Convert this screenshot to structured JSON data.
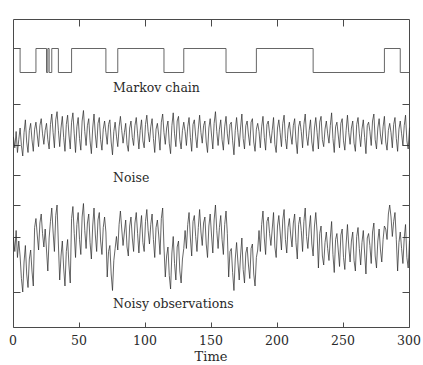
{
  "figure": {
    "background_color": "#ffffff",
    "line_color": "#2b2b2b",
    "frame_color": "#4a4a4a",
    "panel_labels": {
      "markov": "Markov chain",
      "noise": "Noise",
      "observations": "Noisy observations"
    }
  },
  "axis": {
    "xlabel": "Time",
    "ticks": [
      "0",
      "50",
      "100",
      "150",
      "200",
      "250",
      "300"
    ],
    "tick_values": [
      0,
      50,
      100,
      150,
      200,
      250,
      300
    ],
    "xlim": [
      0,
      300
    ]
  },
  "chart_data": {
    "type": "line",
    "title": "",
    "subtitle": "",
    "xlabel": "Time",
    "ylabel": "",
    "xlim": [
      0,
      300
    ],
    "grid": false,
    "legend": "none",
    "annotations": [
      "Markov chain",
      "Noise",
      "Noisy observations"
    ],
    "panels": [
      {
        "name": "markov-chain",
        "label": "Markov chain",
        "type": "step",
        "ylim": [
          0,
          1
        ],
        "description": "Binary hidden state sequence alternating between 0 and 1",
        "segments": [
          {
            "start": 0,
            "end": 5,
            "value": 1
          },
          {
            "start": 5,
            "end": 17,
            "value": 0
          },
          {
            "start": 17,
            "end": 25,
            "value": 1
          },
          {
            "start": 25,
            "end": 26,
            "value": 0
          },
          {
            "start": 26,
            "end": 27,
            "value": 1
          },
          {
            "start": 27,
            "end": 29,
            "value": 0
          },
          {
            "start": 29,
            "end": 34,
            "value": 1
          },
          {
            "start": 34,
            "end": 44,
            "value": 0
          },
          {
            "start": 44,
            "end": 70,
            "value": 1
          },
          {
            "start": 70,
            "end": 79,
            "value": 0
          },
          {
            "start": 79,
            "end": 114,
            "value": 1
          },
          {
            "start": 114,
            "end": 129,
            "value": 0
          },
          {
            "start": 129,
            "end": 161,
            "value": 1
          },
          {
            "start": 161,
            "end": 184,
            "value": 0
          },
          {
            "start": 184,
            "end": 227,
            "value": 1
          },
          {
            "start": 227,
            "end": 281,
            "value": 0
          },
          {
            "start": 281,
            "end": 293,
            "value": 1
          },
          {
            "start": 293,
            "end": 300,
            "value": 0
          }
        ]
      },
      {
        "name": "noise",
        "label": "Noise",
        "type": "line",
        "description": "Zero-mean white noise series over t = 0..300",
        "ylim": [
          -3,
          3
        ],
        "x_step": 1,
        "values": [
          -0.2,
          -1.1,
          0.3,
          -1.5,
          -0.4,
          0.6,
          -0.9,
          -1.8,
          0.2,
          1.3,
          -0.6,
          -1.5,
          0.4,
          1.0,
          -0.4,
          -1.4,
          0.5,
          1.1,
          0.0,
          -1.0,
          0.8,
          1.4,
          0.1,
          -0.8,
          0.4,
          1.0,
          -0.4,
          -1.2,
          0.9,
          1.8,
          0.2,
          -1.1,
          1.3,
          2.0,
          0.4,
          -1.0,
          0.6,
          1.6,
          -0.2,
          -1.4,
          0.9,
          1.7,
          0.0,
          -1.2,
          1.1,
          1.9,
          0.1,
          -1.5,
          0.7,
          1.5,
          -0.3,
          -1.3,
          1.2,
          2.1,
          0.3,
          -0.9,
          0.8,
          1.4,
          -0.5,
          -1.6,
          0.6,
          1.8,
          0.0,
          -1.1,
          1.0,
          1.5,
          -0.4,
          -1.3,
          0.5,
          1.2,
          0.2,
          -0.8,
          0.9,
          1.3,
          -0.6,
          -1.7,
          0.3,
          1.1,
          -0.1,
          -1.0,
          0.7,
          1.6,
          0.4,
          -0.7,
          0.2,
          1.0,
          -0.8,
          -1.4,
          0.6,
          1.2,
          -0.2,
          -0.9,
          0.8,
          1.5,
          0.1,
          -1.2,
          0.4,
          1.3,
          -0.5,
          -1.1,
          0.9,
          1.7,
          0.3,
          -0.6,
          0.7,
          1.4,
          -0.3,
          -1.5,
          0.5,
          1.0,
          0.0,
          -1.3,
          1.1,
          1.8,
          0.2,
          -0.8,
          0.6,
          1.2,
          -0.7,
          -1.6,
          0.8,
          1.9,
          0.1,
          -1.0,
          1.2,
          1.6,
          -0.4,
          -1.2,
          0.4,
          1.1,
          0.3,
          -0.9,
          0.7,
          1.5,
          -0.2,
          -1.4,
          0.9,
          1.3,
          -0.1,
          -1.1,
          0.5,
          1.7,
          0.2,
          -0.7,
          0.8,
          1.2,
          -0.6,
          -1.5,
          0.6,
          1.4,
          0.0,
          -1.2,
          1.0,
          2.0,
          0.3,
          -0.9,
          0.5,
          1.3,
          -0.4,
          -1.3,
          0.7,
          1.6,
          0.1,
          -0.8,
          0.9,
          1.1,
          -0.5,
          -1.7,
          0.4,
          1.5,
          0.2,
          -1.0,
          0.6,
          1.8,
          -0.3,
          -1.2,
          0.8,
          1.2,
          0.0,
          -0.9,
          1.1,
          1.4,
          -0.6,
          -1.4,
          0.5,
          1.0,
          0.3,
          -1.1,
          0.7,
          1.6,
          -0.2,
          -1.3,
          0.9,
          1.2,
          0.1,
          -0.7,
          0.4,
          1.5,
          -0.8,
          -1.5,
          0.6,
          1.3,
          0.2,
          -1.0,
          1.0,
          1.7,
          -0.3,
          -1.2,
          0.5,
          1.1,
          0.0,
          -0.8,
          0.8,
          1.4,
          -0.5,
          -1.6,
          0.7,
          1.2,
          0.3,
          -1.1,
          0.9,
          1.8,
          -0.1,
          -0.9,
          0.4,
          1.3,
          -0.6,
          -1.4,
          0.6,
          1.5,
          0.2,
          -1.2,
          1.1,
          1.6,
          -0.4,
          -1.0,
          0.5,
          1.2,
          0.1,
          -0.7,
          0.8,
          1.9,
          -0.3,
          -1.5,
          0.7,
          1.1,
          0.0,
          -1.1,
          1.0,
          1.4,
          -0.5,
          -1.3,
          0.4,
          1.7,
          0.2,
          -0.8,
          0.6,
          1.2,
          -0.7,
          -1.4,
          0.9,
          1.5,
          0.1,
          -1.0,
          0.5,
          1.3,
          -0.2,
          -1.6,
          0.8,
          1.1,
          0.3,
          -0.9,
          1.2,
          1.8,
          -0.4,
          -1.2,
          0.6,
          1.4,
          0.0,
          -0.8,
          0.7,
          1.6,
          -0.6,
          -1.3,
          0.4,
          1.0,
          0.2,
          -1.1,
          0.9,
          1.5,
          -0.3,
          -1.4,
          0.5,
          1.2,
          0.1,
          -0.9,
          0.8,
          1.7,
          -0.5,
          -1.2,
          0.6
        ]
      },
      {
        "name": "noisy-observations",
        "label": "Noisy observations",
        "type": "line",
        "description": "Sum of the Markov chain state and the noise series",
        "ylim": [
          -3,
          4
        ],
        "x_step": 1,
        "values": [
          0.8,
          -0.1,
          1.3,
          -0.5,
          0.6,
          -0.4,
          -1.9,
          -2.8,
          -0.8,
          0.3,
          -1.6,
          -2.5,
          -0.6,
          0.0,
          -1.4,
          -2.4,
          1.5,
          2.1,
          1.0,
          0.0,
          1.8,
          2.4,
          1.1,
          0.2,
          1.4,
          0.0,
          -1.4,
          0.8,
          1.9,
          2.8,
          1.2,
          -0.1,
          2.3,
          3.0,
          0.4,
          -2.0,
          -0.4,
          0.6,
          -1.2,
          -2.4,
          -0.1,
          0.7,
          -1.0,
          -2.2,
          2.1,
          2.9,
          1.1,
          -0.5,
          1.7,
          2.5,
          0.7,
          -0.3,
          2.2,
          3.1,
          1.3,
          0.1,
          1.8,
          2.4,
          0.5,
          -0.6,
          1.6,
          2.8,
          1.0,
          -0.1,
          2.0,
          2.5,
          0.6,
          -0.3,
          1.5,
          2.2,
          1.2,
          -1.8,
          -0.1,
          0.3,
          -1.6,
          -2.7,
          -0.7,
          0.1,
          0.9,
          -0.0,
          1.7,
          2.6,
          1.4,
          0.3,
          1.2,
          2.0,
          0.2,
          -0.4,
          1.6,
          2.2,
          0.8,
          -0.1,
          1.8,
          2.5,
          1.1,
          -0.2,
          1.4,
          2.3,
          0.5,
          -0.1,
          1.9,
          2.7,
          1.3,
          0.4,
          1.7,
          2.4,
          0.7,
          -0.5,
          1.5,
          2.0,
          1.0,
          -0.3,
          2.1,
          2.8,
          0.2,
          -1.8,
          -0.4,
          0.2,
          -1.7,
          -2.6,
          -0.2,
          0.9,
          -0.9,
          -2.0,
          0.2,
          0.6,
          -1.4,
          -2.2,
          -0.6,
          0.1,
          1.3,
          0.1,
          1.7,
          2.5,
          0.8,
          -0.4,
          1.9,
          2.3,
          0.9,
          -0.1,
          1.5,
          2.7,
          1.2,
          0.3,
          1.8,
          2.2,
          0.4,
          -0.5,
          1.6,
          2.4,
          1.0,
          -0.2,
          2.0,
          3.0,
          1.3,
          0.1,
          1.5,
          2.3,
          0.7,
          -0.3,
          1.7,
          2.6,
          1.1,
          -1.8,
          -0.1,
          0.1,
          -1.5,
          -2.7,
          -0.6,
          0.5,
          -0.8,
          -2.0,
          -0.4,
          0.8,
          -1.3,
          -2.2,
          -0.2,
          0.2,
          -1.0,
          -1.9,
          0.1,
          0.4,
          -1.6,
          -2.4,
          -0.5,
          0.0,
          1.3,
          -0.1,
          1.7,
          2.6,
          0.8,
          -0.3,
          1.9,
          2.2,
          1.1,
          0.3,
          1.4,
          2.5,
          0.2,
          -0.5,
          1.6,
          2.3,
          1.2,
          0.0,
          2.0,
          2.7,
          0.7,
          -0.2,
          1.5,
          2.1,
          1.0,
          0.2,
          1.8,
          2.4,
          0.5,
          -0.6,
          1.7,
          2.2,
          1.3,
          -0.1,
          1.9,
          2.8,
          0.9,
          0.1,
          1.4,
          2.3,
          0.4,
          -0.4,
          1.6,
          2.5,
          1.2,
          -1.2,
          1.1,
          1.6,
          -0.4,
          -1.0,
          0.5,
          1.2,
          0.1,
          -0.7,
          0.8,
          1.9,
          -0.3,
          -1.5,
          0.7,
          1.1,
          0.0,
          -1.1,
          1.0,
          1.4,
          -0.5,
          -1.3,
          0.4,
          1.7,
          0.2,
          -0.8,
          0.6,
          1.2,
          -0.7,
          -1.4,
          0.9,
          1.5,
          0.1,
          -1.0,
          0.5,
          1.3,
          -0.2,
          -1.6,
          0.8,
          1.1,
          0.3,
          -0.9,
          1.2,
          1.8,
          -0.4,
          -1.2,
          0.6,
          1.4,
          0.0,
          -0.8,
          0.7,
          1.6,
          1.4,
          0.7,
          2.4,
          3.0,
          2.2,
          0.9,
          1.9,
          2.5,
          0.7,
          -1.4,
          0.5,
          1.2,
          0.1,
          -0.9,
          0.8,
          1.7,
          -0.5,
          -1.2,
          0.6
        ]
      }
    ]
  }
}
